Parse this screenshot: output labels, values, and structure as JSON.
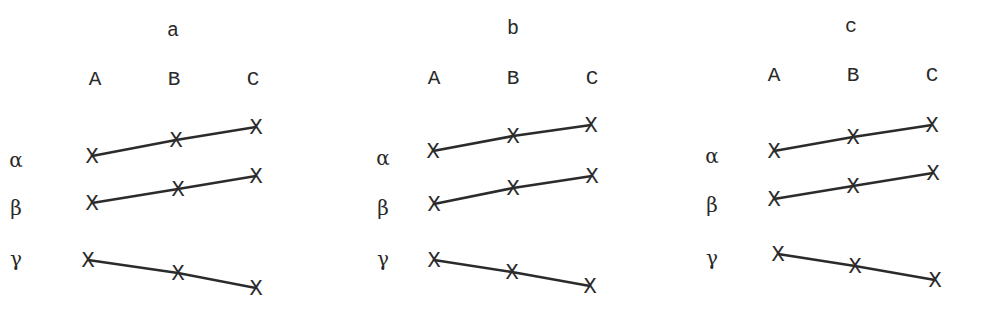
{
  "panels": [
    {
      "title": "a",
      "title_pos": [
        173,
        36
      ],
      "columns": [
        {
          "label": "A",
          "x": 95
        },
        {
          "label": "B",
          "x": 174
        },
        {
          "label": "C",
          "x": 253
        }
      ],
      "columns_y": 85,
      "rows": [
        {
          "label": "α",
          "label_pos": [
            16,
            167
          ],
          "points": [
            [
              92,
              156
            ],
            [
              176,
              140
            ],
            [
              256,
              127
            ]
          ]
        },
        {
          "label": "β",
          "label_pos": [
            16,
            215
          ],
          "points": [
            [
              92,
              203
            ],
            [
              178,
              189
            ],
            [
              256,
              176
            ]
          ]
        },
        {
          "label": "γ",
          "label_pos": [
            16,
            266
          ],
          "points": [
            [
              88,
              260
            ],
            [
              178,
              273
            ],
            [
              256,
              288
            ]
          ]
        }
      ]
    },
    {
      "title": "b",
      "title_pos": [
        513,
        34
      ],
      "columns": [
        {
          "label": "A",
          "x": 434
        },
        {
          "label": "B",
          "x": 513
        },
        {
          "label": "C",
          "x": 592
        }
      ],
      "columns_y": 84,
      "rows": [
        {
          "label": "α",
          "label_pos": [
            383,
            165
          ],
          "points": [
            [
              433,
              151
            ],
            [
              513,
              136
            ],
            [
              591,
              125
            ]
          ]
        },
        {
          "label": "β",
          "label_pos": [
            383,
            215
          ],
          "points": [
            [
              434,
              204
            ],
            [
              513,
              188
            ],
            [
              592,
              176
            ]
          ]
        },
        {
          "label": "γ",
          "label_pos": [
            383,
            266
          ],
          "points": [
            [
              434,
              260
            ],
            [
              512,
              272
            ],
            [
              590,
              286
            ]
          ]
        }
      ]
    },
    {
      "title": "c",
      "title_pos": [
        851,
        32
      ],
      "columns": [
        {
          "label": "A",
          "x": 774
        },
        {
          "label": "B",
          "x": 853
        },
        {
          "label": "C",
          "x": 932
        }
      ],
      "columns_y": 81,
      "rows": [
        {
          "label": "α",
          "label_pos": [
            712,
            163
          ],
          "points": [
            [
              774,
              151
            ],
            [
              853,
              137
            ],
            [
              932,
              125
            ]
          ]
        },
        {
          "label": "β",
          "label_pos": [
            712,
            212
          ],
          "points": [
            [
              774,
              199
            ],
            [
              853,
              186
            ],
            [
              933,
              173
            ]
          ]
        },
        {
          "label": "γ",
          "label_pos": [
            712,
            265
          ],
          "points": [
            [
              778,
              254
            ],
            [
              855,
              266
            ],
            [
              935,
              280
            ]
          ]
        }
      ]
    }
  ],
  "marker_glyph": "X"
}
